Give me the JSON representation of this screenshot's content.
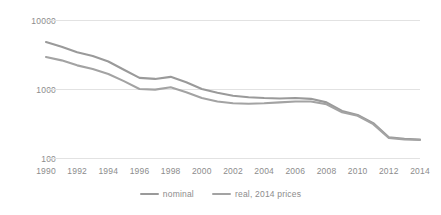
{
  "chart_data": {
    "type": "line",
    "title": "",
    "xlabel": "",
    "ylabel": "",
    "yscale": "log",
    "ylim": [
      100,
      10000
    ],
    "ytick_labels": [
      "10000",
      "1000",
      "100"
    ],
    "ytick_values": [
      10000,
      1000,
      100
    ],
    "grid": true,
    "legend_position": "bottom",
    "x": [
      1990,
      1991,
      1992,
      1993,
      1994,
      1995,
      1996,
      1997,
      1998,
      1999,
      2000,
      2001,
      2002,
      2003,
      2004,
      2005,
      2006,
      2007,
      2008,
      2009,
      2010,
      2011,
      2012,
      2013,
      2014
    ],
    "xtick_labels": [
      "1990",
      "1992",
      "1994",
      "1996",
      "1998",
      "2000",
      "2002",
      "2004",
      "2006",
      "2008",
      "2010",
      "2012",
      "2014"
    ],
    "xtick_values": [
      1990,
      1992,
      1994,
      1996,
      1998,
      2000,
      2002,
      2004,
      2006,
      2008,
      2010,
      2012,
      2014
    ],
    "series": [
      {
        "name": "nominal",
        "color": "#9a9a9a",
        "values": [
          4800,
          4100,
          3400,
          3000,
          2500,
          1900,
          1450,
          1400,
          1500,
          1250,
          1000,
          880,
          800,
          760,
          740,
          730,
          740,
          720,
          640,
          480,
          420,
          320,
          200,
          190,
          185
        ]
      },
      {
        "name": "real, 2014 prices",
        "color": "#a3a3a3",
        "values": [
          2900,
          2600,
          2200,
          1950,
          1650,
          1300,
          1000,
          980,
          1060,
          900,
          740,
          660,
          620,
          610,
          620,
          640,
          660,
          660,
          600,
          460,
          410,
          310,
          195,
          185,
          182
        ]
      }
    ]
  },
  "legend": {
    "items": [
      {
        "label": "nominal"
      },
      {
        "label": "real, 2014 prices"
      }
    ]
  }
}
